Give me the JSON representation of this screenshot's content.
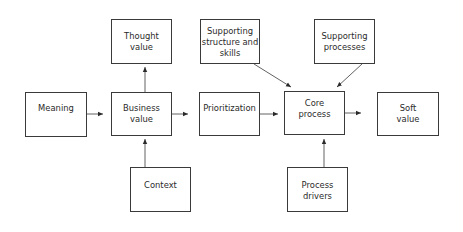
{
  "diagram": {
    "nodes": [
      {
        "id": "meaning",
        "label": "Meaning",
        "x": 25,
        "y": 92,
        "w": 62,
        "h": 45,
        "cls": "mid"
      },
      {
        "id": "business_value",
        "label": "Business\nvalue",
        "x": 111,
        "y": 92,
        "w": 61,
        "h": 44,
        "cls": "mid"
      },
      {
        "id": "prioritization",
        "label": "Prioritization",
        "x": 199,
        "y": 92,
        "w": 61,
        "h": 44,
        "cls": "mid"
      },
      {
        "id": "core_process",
        "label": "Core\nprocess",
        "x": 284,
        "y": 91,
        "w": 61,
        "h": 44,
        "cls": "mid"
      },
      {
        "id": "soft_value",
        "label": "Soft\nvalue",
        "x": 377,
        "y": 92,
        "w": 62,
        "h": 44,
        "cls": "mid"
      },
      {
        "id": "thought_value",
        "label": "Thought\nvalue",
        "x": 111,
        "y": 19,
        "w": 61,
        "h": 45,
        "cls": "top"
      },
      {
        "id": "supporting_structure",
        "label": "Supporting\nstructure and\nskills",
        "x": 200,
        "y": 19,
        "w": 60,
        "h": 45,
        "cls": "top"
      },
      {
        "id": "supporting_processes",
        "label": "Supporting\nprocesses",
        "x": 314,
        "y": 19,
        "w": 61,
        "h": 45,
        "cls": "top"
      },
      {
        "id": "context",
        "label": "Context",
        "x": 130,
        "y": 167,
        "w": 61,
        "h": 45,
        "cls": "low"
      },
      {
        "id": "process_drivers",
        "label": "Process\ndrivers",
        "x": 287,
        "y": 167,
        "w": 61,
        "h": 45,
        "cls": "low"
      }
    ],
    "edges": [
      {
        "from": "meaning",
        "to": "business_value"
      },
      {
        "from": "business_value",
        "to": "prioritization"
      },
      {
        "from": "prioritization",
        "to": "core_process"
      },
      {
        "from": "core_process",
        "to": "soft_value"
      },
      {
        "from": "business_value",
        "to": "thought_value"
      },
      {
        "from": "context",
        "to": "business_value"
      },
      {
        "from": "supporting_structure",
        "to": "core_process"
      },
      {
        "from": "supporting_processes",
        "to": "core_process"
      },
      {
        "from": "process_drivers",
        "to": "core_process"
      }
    ],
    "colors": {
      "stroke": "#3a3a3a",
      "text": "#2a2a2a",
      "background": "#ffffff"
    }
  }
}
